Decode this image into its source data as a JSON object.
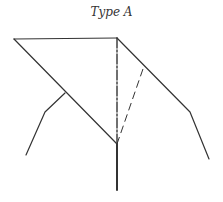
{
  "diagram": {
    "title": "Type A",
    "stroke_color": "#333333",
    "nodes": {
      "top_left": [
        14,
        39
      ],
      "apex": [
        117,
        38
      ],
      "junction": [
        117,
        144
      ],
      "stem_bottom": [
        117,
        190
      ],
      "left_branch_start": [
        65,
        93
      ],
      "left_branch_bend": [
        45,
        112
      ],
      "left_branch_end": [
        26,
        155
      ],
      "right_bend": [
        190,
        112
      ],
      "right_end": [
        209,
        159
      ],
      "dash_top": [
        144,
        66
      ]
    },
    "edges": [
      {
        "from": "top_left",
        "to": "apex",
        "style": "solid"
      },
      {
        "from": "top_left",
        "to": "junction",
        "style": "solid"
      },
      {
        "from": "apex",
        "to": "junction",
        "style": "dash-dot"
      },
      {
        "from": "junction",
        "to": "stem_bottom",
        "style": "solid-thick"
      },
      {
        "from": "left_branch_start",
        "to": "left_branch_bend",
        "style": "solid"
      },
      {
        "from": "left_branch_bend",
        "to": "left_branch_end",
        "style": "solid"
      },
      {
        "from": "apex",
        "to": "right_bend",
        "style": "solid"
      },
      {
        "from": "right_bend",
        "to": "right_end",
        "style": "solid"
      },
      {
        "from": "junction",
        "to": "dash_top",
        "style": "dashed"
      }
    ]
  }
}
